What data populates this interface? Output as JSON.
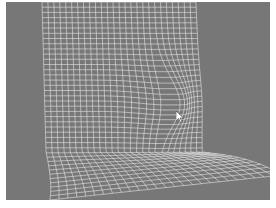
{
  "image": {
    "description": "Grayscale render of a deformed white wireframe mesh sheet forming an L shape (vertical wall bending into a floor) with a bulge near center, on a gray background",
    "colors": {
      "background": "#777777",
      "mesh": "#e8e8e8",
      "border": "#ffffff"
    },
    "cursor": {
      "x": 180,
      "y": 117
    }
  }
}
